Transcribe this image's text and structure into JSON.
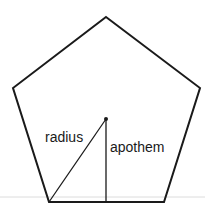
{
  "diagram": {
    "shape": "pentagon",
    "vertices": [
      [
        106,
        17
      ],
      [
        200,
        88
      ],
      [
        164,
        202
      ],
      [
        49,
        202
      ],
      [
        13,
        88
      ]
    ],
    "center": [
      106,
      119
    ],
    "labels": {
      "radius": "radius",
      "apothem": "apothem"
    },
    "colors": {
      "stroke": "#1a1a1a",
      "background": "#ffffff",
      "faint_line": "#d8d8d8"
    }
  }
}
